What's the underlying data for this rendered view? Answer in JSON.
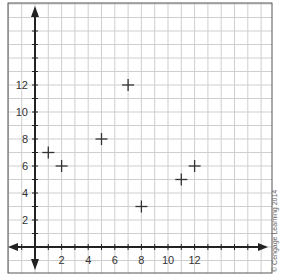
{
  "chart_data": {
    "type": "scatter",
    "title": "",
    "xlabel": "",
    "ylabel": "",
    "xlim": [
      -2,
      17
    ],
    "ylim": [
      -2,
      18
    ],
    "grid": true,
    "x_tick_labels": [
      "2",
      "4",
      "6",
      "8",
      "10",
      "12"
    ],
    "x_ticks": [
      2,
      4,
      6,
      8,
      10,
      12
    ],
    "y_tick_labels": [
      "2",
      "4",
      "6",
      "8",
      "10",
      "12"
    ],
    "y_ticks": [
      2,
      4,
      6,
      8,
      10,
      12
    ],
    "marker": "+",
    "points": [
      {
        "x": 1,
        "y": 7
      },
      {
        "x": 2,
        "y": 6
      },
      {
        "x": 5,
        "y": 8
      },
      {
        "x": 7,
        "y": 12
      },
      {
        "x": 8,
        "y": 3
      },
      {
        "x": 11,
        "y": 5
      },
      {
        "x": 12,
        "y": 6
      }
    ],
    "legend": null
  },
  "colors": {
    "grid": "#cfcfcf",
    "axis": "#222222",
    "frame": "#555555",
    "marker": "#333333"
  },
  "credit": "© Cengage Learning 2014"
}
